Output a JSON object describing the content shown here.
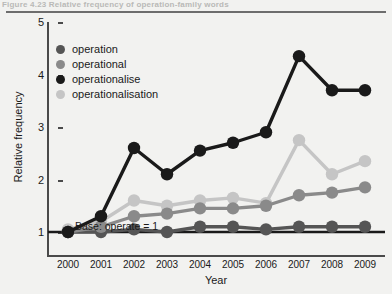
{
  "figure": {
    "caption": "Figure 4.23   Relative frequency of operation-family words"
  },
  "axes": {
    "y_title": "Relative frequency",
    "x_title": "Year",
    "y_ticks": [
      "1",
      "2",
      "3",
      "4",
      "5"
    ],
    "x_ticks": [
      "2000",
      "2001",
      "2002",
      "2003",
      "2004",
      "2005",
      "2006",
      "2007",
      "2008",
      "2009"
    ]
  },
  "annotation": {
    "baseline_note": "Base: operate = 1"
  },
  "legend": {
    "items": [
      {
        "label": "operation",
        "color": "#555555"
      },
      {
        "label": "operational",
        "color": "#8a8a8a"
      },
      {
        "label": "operationalise",
        "color": "#1a1a1a"
      },
      {
        "label": "operationalisation",
        "color": "#c5c5c5"
      }
    ]
  },
  "chart_data": {
    "type": "line",
    "title": "Relative frequency of operation-family words",
    "xlabel": "Year",
    "ylabel": "Relative frequency",
    "x": [
      2000,
      2001,
      2002,
      2003,
      2004,
      2005,
      2006,
      2007,
      2008,
      2009
    ],
    "categories": [
      "2000",
      "2001",
      "2002",
      "2003",
      "2004",
      "2005",
      "2006",
      "2007",
      "2008",
      "2009"
    ],
    "ylim": [
      0.55,
      5
    ],
    "xlim": [
      1999.5,
      2009.8
    ],
    "grid": false,
    "legend_position": "top-left",
    "annotations": [
      {
        "text": "Base: operate = 1",
        "x": 2001.2,
        "y": 1.25
      }
    ],
    "reference_line": {
      "y": 1,
      "label": "Base: operate = 1",
      "color": "#1a1a1a"
    },
    "series": [
      {
        "name": "operation",
        "color": "#555555",
        "values": [
          1.0,
          1.0,
          1.05,
          1.0,
          1.1,
          1.1,
          1.05,
          1.1,
          1.1,
          1.1
        ]
      },
      {
        "name": "operational",
        "color": "#8a8a8a",
        "values": [
          1.0,
          1.1,
          1.3,
          1.35,
          1.45,
          1.45,
          1.5,
          1.7,
          1.75,
          1.85
        ]
      },
      {
        "name": "operationalise",
        "color": "#1a1a1a",
        "values": [
          1.0,
          1.3,
          2.6,
          2.1,
          2.55,
          2.7,
          2.9,
          4.35,
          3.7,
          3.7
        ]
      },
      {
        "name": "operationalisation",
        "color": "#c5c5c5",
        "values": [
          1.05,
          1.2,
          1.6,
          1.5,
          1.6,
          1.65,
          1.55,
          2.75,
          2.1,
          2.35
        ]
      }
    ]
  }
}
